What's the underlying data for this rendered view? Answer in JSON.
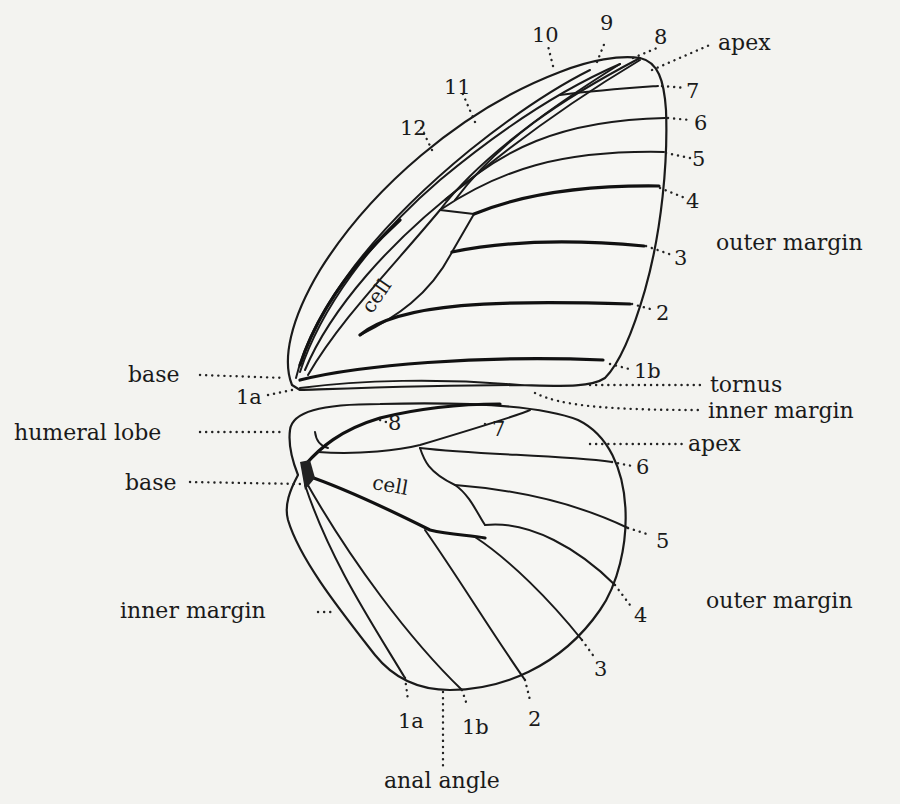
{
  "diagram": {
    "colors": {
      "background": "#f3f3f0",
      "ink": "#1a1a1a"
    },
    "forewing": {
      "vein_labels": [
        "10",
        "9",
        "8",
        "7",
        "6",
        "5",
        "4",
        "3",
        "2",
        "1b",
        "12",
        "11",
        "1a"
      ],
      "region_labels": {
        "apex": "apex",
        "outer_margin": "outer margin",
        "tornus": "tornus",
        "inner_margin": "inner margin",
        "base": "base",
        "cell": "cell"
      }
    },
    "hindwing": {
      "vein_labels": [
        "8",
        "7",
        "6",
        "5",
        "4",
        "3",
        "2",
        "1b",
        "1a"
      ],
      "region_labels": {
        "humeral_lobe": "humeral lobe",
        "base": "base",
        "apex": "apex",
        "outer_margin": "outer margin",
        "inner_margin": "inner margin",
        "anal_angle": "anal angle",
        "cell": "cell"
      }
    }
  }
}
